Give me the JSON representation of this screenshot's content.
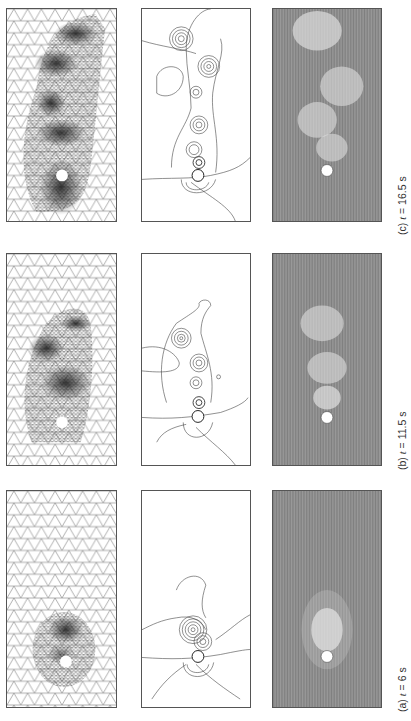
{
  "figure": {
    "orientation": "rotated-90-ccw",
    "columns": [
      "mesh",
      "vorticity-contours",
      "streamlines"
    ],
    "rows": [
      {
        "id": "c",
        "label": "(c)",
        "var": "t",
        "eq": "=",
        "value": "16.5 s",
        "caption": "(c)  t = 16.5 s"
      },
      {
        "id": "b",
        "label": "(b)",
        "var": "t",
        "eq": "=",
        "value": "11.5 s",
        "caption": "(b)  t = 11.5 s"
      },
      {
        "id": "a",
        "label": "(a)",
        "var": "t",
        "eq": "=",
        "value": "6 s",
        "caption": "(a)  t = 6 s"
      }
    ],
    "colors": {
      "mesh_line": "#555555",
      "contour_line": "#444444",
      "stream_bg": "#9a9a9a",
      "cylinder": "#ffffff"
    }
  }
}
